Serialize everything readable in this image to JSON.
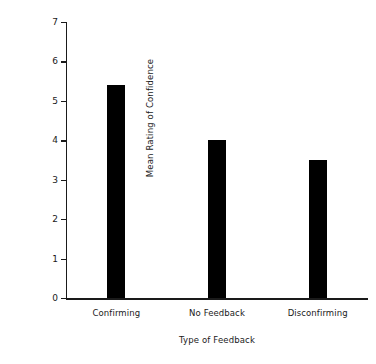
{
  "chart_data": {
    "type": "bar",
    "title": "",
    "xlabel": "Type of Feedback",
    "ylabel": "Mean Rating of Confidence",
    "categories": [
      "Confirming",
      "No Feedback",
      "Disconfirming"
    ],
    "values": [
      5.4,
      4.0,
      3.5
    ],
    "ylim": [
      0,
      7
    ],
    "ytick_labels": [
      "0",
      "1",
      "2",
      "3",
      "4",
      "5",
      "6",
      "7"
    ],
    "ytick_values": [
      0,
      1,
      2,
      3,
      4,
      5,
      6,
      7
    ],
    "grid": false,
    "legend": false,
    "legend_position": "none",
    "bar_color": "#000000",
    "axis_color": "#1a1a1a",
    "background_color": "#ffffff"
  },
  "axes": {
    "y_title": "Mean Rating of Confidence",
    "x_title": "Type of Feedback"
  }
}
